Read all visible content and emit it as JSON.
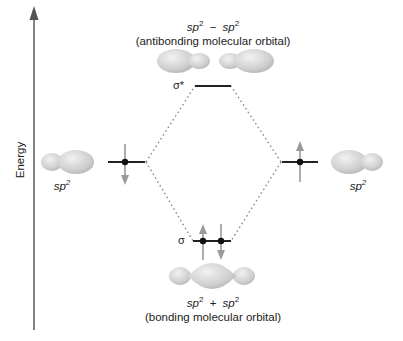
{
  "axis": {
    "label": "Energy"
  },
  "antibonding": {
    "formula_a": "sp",
    "exp_a": "2",
    "operator": "−",
    "formula_b": "sp",
    "exp_b": "2",
    "description": "(antibonding molecular orbital)",
    "level_label": "σ*"
  },
  "bonding": {
    "formula_a": "sp",
    "exp_a": "2",
    "operator": "+",
    "formula_b": "sp",
    "exp_b": "2",
    "description": "(bonding molecular orbital)",
    "level_label": "σ"
  },
  "left_atomic": {
    "label": "sp",
    "exp": "2",
    "electron_spin": "down"
  },
  "right_atomic": {
    "label": "sp",
    "exp": "2",
    "electron_spin": "up"
  },
  "colors": {
    "orbital_fill": "#c9c9c9",
    "orbital_light": "#ececec",
    "arrow": "#9a9a9a",
    "line": "#222222",
    "dots": "#8a8a8a"
  }
}
